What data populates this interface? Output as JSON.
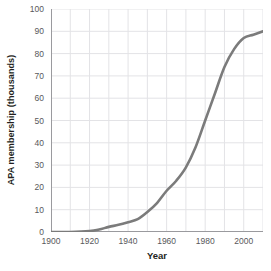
{
  "chart_data": {
    "type": "line",
    "title": "",
    "xlabel": "Year",
    "ylabel": "APA membership (thousands)",
    "xlim": [
      1900,
      2010
    ],
    "ylim": [
      0,
      100
    ],
    "grid": true,
    "legend": false,
    "line_color": "#7b7b7b",
    "grid_color": "#e3e3e6",
    "axis_color": "#9a9a9e",
    "tick_color": "#58585b",
    "x_ticks": [
      1900,
      1920,
      1940,
      1960,
      1980,
      2000
    ],
    "x_tick_labels": [
      "1900",
      "1920",
      "1940",
      "1960",
      "1980",
      "2000"
    ],
    "x_minor_step": 10,
    "y_ticks": [
      0,
      10,
      20,
      30,
      40,
      50,
      60,
      70,
      80,
      90,
      100
    ],
    "y_tick_labels": [
      "0",
      "10",
      "20",
      "30",
      "40",
      "50",
      "60",
      "70",
      "80",
      "90",
      "100"
    ],
    "series": [
      {
        "name": "APA membership",
        "x": [
          1900,
          1910,
          1920,
          1925,
          1930,
          1935,
          1940,
          1945,
          1950,
          1955,
          1960,
          1965,
          1970,
          1975,
          1980,
          1985,
          1990,
          1995,
          2000,
          2005,
          2010
        ],
        "values": [
          0,
          0,
          0.4,
          1.1,
          2.3,
          3.2,
          4.4,
          5.8,
          9.0,
          13.0,
          18.5,
          23.0,
          29.0,
          38.0,
          50.0,
          62.0,
          74.0,
          82.0,
          87.0,
          88.5,
          90.0
        ]
      }
    ]
  }
}
